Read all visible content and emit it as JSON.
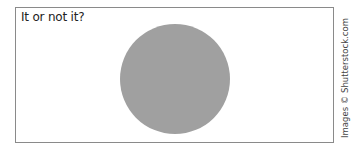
{
  "figure": {
    "caption": "It or not it?",
    "shape": "circle",
    "circle_color": "#a0a0a0",
    "frame_color": "#8a8a8a"
  },
  "credit": "Images © Shutterstock.com"
}
